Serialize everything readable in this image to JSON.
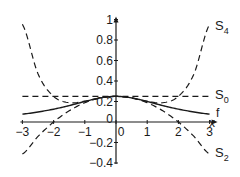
{
  "chart_data": {
    "type": "line",
    "title": "",
    "xlabel": "x",
    "ylabel": "",
    "xlim": [
      -3,
      3
    ],
    "ylim": [
      -0.4,
      1
    ],
    "grid": false,
    "legend_position": "inline-right",
    "x_ticks": [
      -3,
      -2,
      -1,
      0,
      1,
      2,
      3
    ],
    "x_tick_labels": [
      "−3",
      "−2",
      "−1",
      "0",
      "1",
      "2",
      "3"
    ],
    "y_ticks": [
      -0.4,
      -0.2,
      0,
      0.2,
      0.4,
      0.6,
      0.8,
      1
    ],
    "y_tick_labels": [
      "−0.4",
      "−0.2",
      "0",
      "0.2",
      "0.4",
      "0.6",
      "0.8",
      "1"
    ],
    "x": [
      -3,
      -2.5,
      -2,
      -1.5,
      -1,
      -0.5,
      0,
      0.5,
      1,
      1.5,
      2,
      2.5,
      3
    ],
    "series": [
      {
        "name": "f",
        "style": "solid",
        "values": [
          0.077,
          0.098,
          0.125,
          0.16,
          0.2,
          0.235,
          0.25,
          0.235,
          0.2,
          0.16,
          0.125,
          0.098,
          0.077
        ]
      },
      {
        "name": "S0",
        "style": "dashed",
        "values": [
          0.25,
          0.25,
          0.25,
          0.25,
          0.25,
          0.25,
          0.25,
          0.25,
          0.25,
          0.25,
          0.25,
          0.25,
          0.25
        ]
      },
      {
        "name": "S2",
        "style": "dashed",
        "values": [
          -0.313,
          -0.141,
          0.0,
          0.109,
          0.188,
          0.234,
          0.25,
          0.234,
          0.188,
          0.109,
          0.0,
          -0.141,
          -0.313
        ]
      },
      {
        "name": "S4",
        "style": "dashed",
        "values": [
          0.953,
          0.47,
          0.25,
          0.188,
          0.203,
          0.235,
          0.25,
          0.235,
          0.203,
          0.188,
          0.25,
          0.47,
          0.953
        ]
      }
    ],
    "annotations": [
      {
        "text": "S",
        "sub": "4",
        "series": "S4"
      },
      {
        "text": "S",
        "sub": "0",
        "series": "S0"
      },
      {
        "text": "f",
        "sub": "",
        "series": "f"
      },
      {
        "text": "S",
        "sub": "2",
        "series": "S2"
      }
    ]
  },
  "labels": {
    "x_axis": "x",
    "s4": "S",
    "s4_sub": "4",
    "s0": "S",
    "s0_sub": "0",
    "f": "f",
    "s2": "S",
    "s2_sub": "2"
  }
}
